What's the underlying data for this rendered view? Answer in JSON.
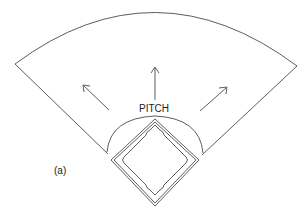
{
  "diagram": {
    "type": "baseball-field-schematic",
    "labels": {
      "pitch": "PITCH",
      "panel": "(a)"
    },
    "elements": {
      "outfield_arc": "outfield boundary arc",
      "foul_lines": [
        "left foul line",
        "right foul line"
      ],
      "infield_arc": "infield arc around diamond",
      "diamond": "infield diamond with bases",
      "arrows": [
        "arrow toward left field",
        "arrow toward center field",
        "arrow toward right field"
      ]
    },
    "colors": {
      "line": "#333333",
      "background": "#ffffff"
    }
  }
}
